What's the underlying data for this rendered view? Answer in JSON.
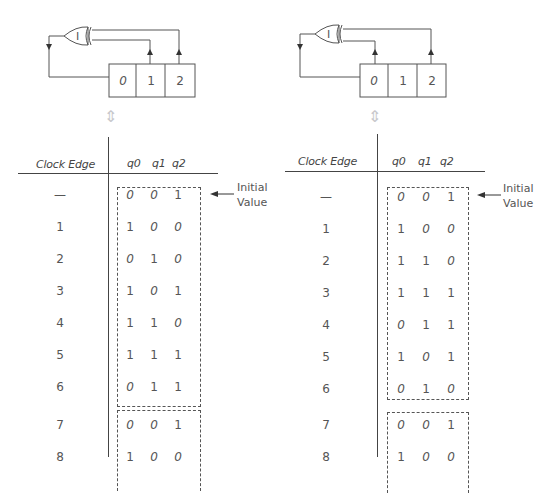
{
  "panels": [
    {
      "id": "left",
      "gate_label": "I",
      "gate_type": "XOR",
      "tap_cells": [
        1,
        2
      ],
      "register_cells": [
        "0",
        "1",
        "2"
      ],
      "table": {
        "header_edge": "Clock Edge",
        "header_bits": [
          "q0",
          "q1",
          "q2"
        ],
        "rows": [
          {
            "edge": "—",
            "bits": [
              "0",
              "0",
              "1"
            ]
          },
          {
            "edge": "1",
            "bits": [
              "1",
              "0",
              "0"
            ]
          },
          {
            "edge": "2",
            "bits": [
              "0",
              "1",
              "0"
            ]
          },
          {
            "edge": "3",
            "bits": [
              "1",
              "0",
              "1"
            ]
          },
          {
            "edge": "4",
            "bits": [
              "1",
              "1",
              "0"
            ]
          },
          {
            "edge": "5",
            "bits": [
              "1",
              "1",
              "1"
            ]
          },
          {
            "edge": "6",
            "bits": [
              "0",
              "1",
              "1"
            ]
          },
          {
            "edge": "7",
            "bits": [
              "0",
              "0",
              "1"
            ]
          },
          {
            "edge": "8",
            "bits": [
              "1",
              "0",
              "0"
            ]
          }
        ],
        "cycle_length": 7
      },
      "note": {
        "line1": "Initial",
        "line2": "Value"
      }
    },
    {
      "id": "right",
      "gate_label": "I",
      "gate_type": "XOR",
      "tap_cells": [
        0,
        2
      ],
      "register_cells": [
        "0",
        "1",
        "2"
      ],
      "table": {
        "header_edge": "Clock Edge",
        "header_bits": [
          "q0",
          "q1",
          "q2"
        ],
        "rows": [
          {
            "edge": "—",
            "bits": [
              "0",
              "0",
              "1"
            ]
          },
          {
            "edge": "1",
            "bits": [
              "1",
              "0",
              "0"
            ]
          },
          {
            "edge": "2",
            "bits": [
              "1",
              "1",
              "0"
            ]
          },
          {
            "edge": "3",
            "bits": [
              "1",
              "1",
              "1"
            ]
          },
          {
            "edge": "4",
            "bits": [
              "0",
              "1",
              "1"
            ]
          },
          {
            "edge": "5",
            "bits": [
              "1",
              "0",
              "1"
            ]
          },
          {
            "edge": "6",
            "bits": [
              "0",
              "1",
              "0"
            ]
          },
          {
            "edge": "7",
            "bits": [
              "0",
              "0",
              "1"
            ]
          },
          {
            "edge": "8",
            "bits": [
              "1",
              "0",
              "0"
            ]
          }
        ],
        "cycle_length": 7
      },
      "note": {
        "line1": "Initial",
        "line2": "Value"
      }
    }
  ],
  "colors": {
    "line": "#444444",
    "text": "#555555",
    "double_arrow": "#c8c8cc"
  }
}
